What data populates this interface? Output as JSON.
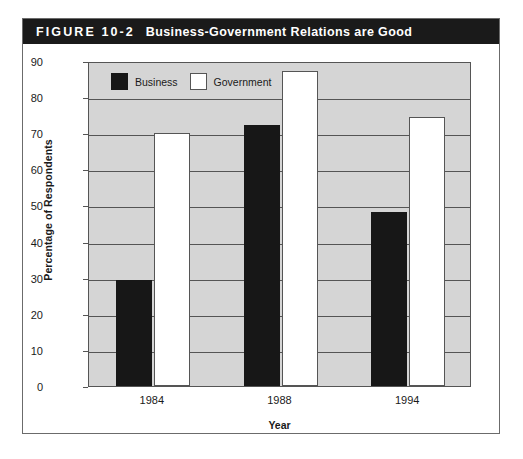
{
  "figure": {
    "number": "FIGURE 10-2",
    "title": "Business-Government Relations are Good",
    "title_bar_color": "#1a1a1a",
    "title_text_color": "#ffffff"
  },
  "chart_data": {
    "type": "bar",
    "title": "Business-Government Relations are Good",
    "categories": [
      "1984",
      "1988",
      "1994"
    ],
    "series": [
      {
        "name": "Business",
        "color": "#171717",
        "values": [
          29.4,
          72.2,
          48.3
        ]
      },
      {
        "name": "Government",
        "color": "#ffffff",
        "values": [
          70.0,
          87.2,
          74.5
        ]
      }
    ],
    "xlabel": "Year",
    "ylabel": "Percentage of Respondents",
    "ylim": [
      0,
      90
    ],
    "yticks": [
      0,
      10,
      20,
      30,
      40,
      50,
      60,
      70,
      80,
      90
    ],
    "ytick_labels": [
      "0",
      "10",
      "20",
      "30",
      "40",
      "50",
      "60",
      "70",
      "80",
      "90"
    ],
    "grid": true,
    "grid_axis": "y",
    "legend_position": "upper-left-inside",
    "plot_background": "#d5d5d5"
  }
}
